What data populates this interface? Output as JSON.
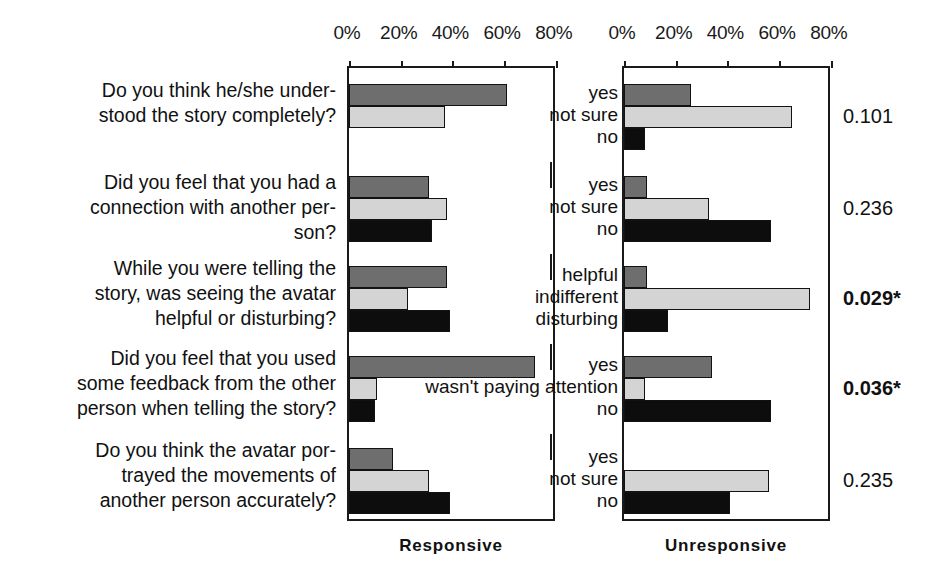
{
  "figure": {
    "panels": [
      {
        "name": "responsive",
        "caption": "Responsive"
      },
      {
        "name": "unresponsive",
        "caption": "Unresponsive"
      }
    ],
    "axis_ticks": [
      "0%",
      "20%",
      "40%",
      "60%",
      "80%"
    ],
    "questions": [
      "Do you think he/she under-\nstood the story completely?",
      "Did you feel that you had a\nconnection with another per-\nson?",
      "While you were telling the\nstory, was seeing the avatar\nhelpful or disturbing?",
      "Did you feel that you used\nsome feedback from the other\nperson when telling the story?",
      "Do you think the avatar por-\ntrayed the movements of\nanother person accurately?"
    ],
    "question_lines": [
      [
        "Do you think he/she under-",
        "stood the story completely?"
      ],
      [
        "Did you feel that you had a",
        "connection with another per-",
        "son?"
      ],
      [
        "While you were telling the",
        "story, was seeing the avatar",
        "helpful or disturbing?"
      ],
      [
        "Did you feel that you used",
        "some feedback from the other",
        "person when telling the story?"
      ],
      [
        "Do you think the avatar por-",
        "trayed the movements of",
        "another person accurately?"
      ]
    ],
    "p_values": [
      {
        "value": "0.101",
        "significant": false
      },
      {
        "value": "0.236",
        "significant": false
      },
      {
        "value": "0.029*",
        "significant": true
      },
      {
        "value": "0.036*",
        "significant": true
      },
      {
        "value": "0.235",
        "significant": false
      }
    ]
  },
  "chart_data": {
    "type": "bar",
    "orientation": "horizontal",
    "title": "",
    "xlabel": "",
    "ylabel": "",
    "xlim": [
      0,
      88
    ],
    "xticks": [
      0,
      20,
      40,
      60,
      80
    ],
    "xticklabels": [
      "0%",
      "20%",
      "40%",
      "60%",
      "80%"
    ],
    "grid": false,
    "legend": "none",
    "panels": [
      "Responsive",
      "Unresponsive"
    ],
    "groups": [
      {
        "question": "Do you think he/she understood the story completely?",
        "categories": [
          "yes",
          "not sure",
          "no"
        ],
        "p_value": "0.101",
        "significant": false,
        "responsive": [
          61,
          37,
          0
        ],
        "unresponsive": [
          26,
          65,
          8
        ]
      },
      {
        "question": "Did you feel that you had a connection with another person?",
        "categories": [
          "yes",
          "not sure",
          "no"
        ],
        "p_value": "0.236",
        "significant": false,
        "responsive": [
          31,
          38,
          32
        ],
        "unresponsive": [
          9,
          33,
          57
        ]
      },
      {
        "question": "While you were telling the story, was seeing the avatar helpful or disturbing?",
        "categories": [
          "helpful",
          "indifferent",
          "disturbing"
        ],
        "p_value": "0.029*",
        "significant": true,
        "responsive": [
          38,
          23,
          39
        ],
        "unresponsive": [
          9,
          72,
          17
        ]
      },
      {
        "question": "Did you feel that you used some feedback from the other person when telling the story?",
        "categories": [
          "yes",
          "wasn't paying attention",
          "no"
        ],
        "p_value": "0.036*",
        "significant": true,
        "responsive": [
          72,
          11,
          10
        ],
        "unresponsive": [
          34,
          8,
          57
        ]
      },
      {
        "question": "Do you think the avatar portrayed the movements of another person accurately?",
        "categories": [
          "yes",
          "not sure",
          "no"
        ],
        "p_value": "0.235",
        "significant": false,
        "responsive": [
          17,
          31,
          39
        ],
        "unresponsive": [
          0,
          56,
          41
        ]
      }
    ],
    "series_colors": [
      "#6e6e6e",
      "#d4d4d4",
      "#0d0d0d"
    ]
  }
}
